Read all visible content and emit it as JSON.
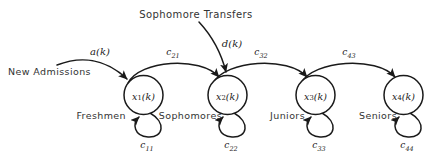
{
  "diagram": {
    "background_color": "#ffffff",
    "stroke_color": "#1a1a1a",
    "text_color": "#333333",
    "external_inputs": [
      {
        "id": "new-admissions",
        "source_label": "New Admissions",
        "signal_label": "a(k)",
        "target_state": "x1"
      },
      {
        "id": "sophomore-transfers",
        "source_label": "Sophomore Transfers",
        "signal_label": "d(k)",
        "target_state": "x2"
      }
    ],
    "nodes": [
      {
        "id": "x1",
        "state_var": "x",
        "state_index": "1",
        "state_arg": "(k)",
        "class_label": "Freshmen",
        "self_loop_coef": "c",
        "self_loop_sub": "11",
        "cx": 143.5,
        "cy": 95,
        "r": 19.5,
        "label_side": "left"
      },
      {
        "id": "x2",
        "state_var": "x",
        "state_index": "2",
        "state_arg": "(k)",
        "class_label": "Sophomores",
        "self_loop_coef": "c",
        "self_loop_sub": "22",
        "cx": 227.5,
        "cy": 95,
        "r": 19.5,
        "label_side": "left"
      },
      {
        "id": "x3",
        "state_var": "x",
        "state_index": "3",
        "state_arg": "(k)",
        "class_label": "Juniors",
        "self_loop_coef": "c",
        "self_loop_sub": "33",
        "cx": 315.5,
        "cy": 95,
        "r": 19.5,
        "label_side": "left"
      },
      {
        "id": "x4",
        "state_var": "x",
        "state_index": "4",
        "state_arg": "(k)",
        "class_label": "Seniors",
        "self_loop_coef": "c",
        "self_loop_sub": "44",
        "cx": 403.5,
        "cy": 95,
        "r": 19.5,
        "label_side": "left"
      }
    ],
    "transitions": [
      {
        "id": "c21",
        "from": "x1",
        "to": "x2",
        "coef": "c",
        "sub": "21"
      },
      {
        "id": "c32",
        "from": "x2",
        "to": "x3",
        "coef": "c",
        "sub": "32"
      },
      {
        "id": "c43",
        "from": "x3",
        "to": "x4",
        "coef": "c",
        "sub": "43"
      }
    ]
  }
}
